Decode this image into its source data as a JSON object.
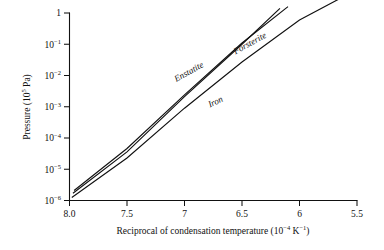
{
  "chart_data": {
    "type": "line",
    "title": "",
    "xlabel": "Reciprocal of condensation temperature (10⁻⁴ K⁻¹)",
    "ylabel": "Pressure (10⁵ Pa)",
    "xlabel_main": "Reciprocal of condensation temperature (10",
    "xlabel_exp1": "−4",
    "xlabel_mid": " K",
    "xlabel_exp2": "−1",
    "xlabel_tail": ")",
    "ylabel_main": "Pressure (10",
    "ylabel_exp": "5",
    "ylabel_tail": " Pa)",
    "xlim": [
      8.0,
      5.5
    ],
    "xaxis_reversed": true,
    "ylim": [
      1e-06,
      1
    ],
    "yscale": "log",
    "grid": false,
    "legend": "inline-curve-labels",
    "xticks": [
      8.0,
      7.5,
      7.0,
      6.5,
      6.0,
      5.5
    ],
    "xticklabels": [
      "8.0",
      "7.5",
      "7",
      "6.5",
      "6",
      "5.5"
    ],
    "yticks": [
      1,
      0.1,
      0.01,
      0.001,
      0.0001,
      1e-05,
      1e-06
    ],
    "yticklabels": [
      "1",
      "10⁻¹",
      "10⁻²",
      "10⁻³",
      "10⁻⁴",
      "10⁻⁵",
      "10⁻⁶"
    ],
    "series": [
      {
        "name": "Enstatite",
        "label_angle_deg": -29,
        "x": [
          7.96,
          7.5,
          7.0,
          6.5,
          6.1
        ],
        "y": [
          2.1e-06,
          4.6e-05,
          0.0024,
          0.11,
          1.6
        ]
      },
      {
        "name": "Forsterite",
        "label_angle_deg": -29,
        "x": [
          7.97,
          7.5,
          7.0,
          6.5,
          6.17
        ],
        "y": [
          1.7e-06,
          3.6e-05,
          0.0021,
          0.1,
          1.4
        ]
      },
      {
        "name": "Iron",
        "label_angle_deg": -26,
        "x": [
          7.98,
          7.5,
          7.0,
          6.5,
          6.0,
          5.62
        ],
        "y": [
          1.25e-06,
          2.3e-05,
          0.0009,
          0.027,
          0.6,
          3.3
        ]
      }
    ],
    "annotations": [
      {
        "text": "Enstatite",
        "x": 6.95,
        "y": 0.011
      },
      {
        "text": "Forsterite",
        "x": 6.42,
        "y": 0.09
      },
      {
        "text": "Iron",
        "x": 6.72,
        "y": 0.0012
      }
    ]
  },
  "style": {
    "line_color": "#111111",
    "axis_color": "#111111",
    "background": "#ffffff"
  }
}
